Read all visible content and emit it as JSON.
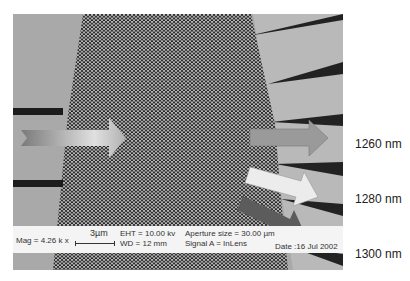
{
  "figure": {
    "type": "SEM micrograph of photonic crystal wavelength demultiplexer",
    "info_bar": {
      "mag": "Mag = 4.26 k x",
      "scale_bar": "3µm",
      "eht": "EHT = 10.00 kv",
      "wd": "WD = 12 mm",
      "aperture": "Aperture size = 30.00 µm",
      "signal": "Signal A = InLens",
      "date": "Date :16 Jul 2002"
    },
    "wavelength_labels": [
      "1260 nm",
      "1280 nm",
      "1300 nm"
    ],
    "arrows": [
      {
        "name": "input-arrow",
        "color": "#b8b8b8"
      },
      {
        "name": "output-1260",
        "color": "#9a9a9a"
      },
      {
        "name": "output-1280",
        "color": "#eaeaea"
      },
      {
        "name": "output-1300",
        "color": "#5c5c5c"
      }
    ]
  }
}
